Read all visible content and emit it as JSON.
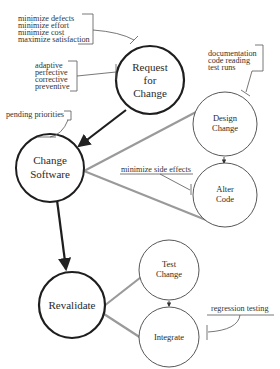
{
  "diagram": {
    "nodes": [
      {
        "id": "request",
        "lines": [
          "Request",
          "for",
          "Change"
        ]
      },
      {
        "id": "change_software",
        "lines": [
          "Change",
          "Software"
        ]
      },
      {
        "id": "design_change",
        "lines": [
          "Design",
          "Change"
        ]
      },
      {
        "id": "alter_code",
        "lines": [
          "Alter",
          "Code"
        ]
      },
      {
        "id": "revalidate",
        "lines": [
          "Revalidate"
        ]
      },
      {
        "id": "test_change",
        "lines": [
          "Test",
          "Change"
        ]
      },
      {
        "id": "integrate",
        "lines": [
          "Integrate"
        ]
      }
    ],
    "annotations": {
      "goals": [
        "minimize defects",
        "minimize effort",
        "minimize cost",
        "maximize satisfaction"
      ],
      "types": [
        "adaptive",
        "perfective",
        "corrective",
        "preventive"
      ],
      "pending": [
        "pending priorities"
      ],
      "design_inputs": [
        "documentation",
        "code reading",
        "test runs"
      ],
      "side_effects": [
        "minimize side effects"
      ],
      "regression": [
        "regression testing"
      ]
    },
    "edges": [
      {
        "from": "request",
        "to": "change_software",
        "style": "bold-arrow"
      },
      {
        "from": "change_software",
        "to": "revalidate",
        "style": "bold-arrow"
      },
      {
        "from": "design_change",
        "to": "alter_code",
        "style": "thin-arrow"
      },
      {
        "from": "test_change",
        "to": "integrate",
        "style": "thin-arrow"
      },
      {
        "from": "change_software",
        "to": "design_change",
        "style": "gray-decomposition"
      },
      {
        "from": "change_software",
        "to": "alter_code",
        "style": "gray-decomposition"
      },
      {
        "from": "revalidate",
        "to": "test_change",
        "style": "gray-decomposition"
      },
      {
        "from": "revalidate",
        "to": "integrate",
        "style": "gray-decomposition"
      }
    ]
  }
}
